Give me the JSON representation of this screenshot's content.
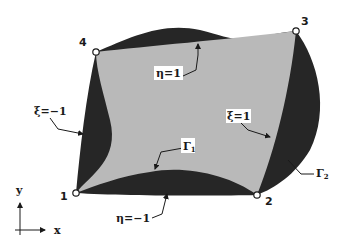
{
  "figure": {
    "colors": {
      "background": "#ffffff",
      "domain_fill": "#b9b9b9",
      "boundary_region_fill": "#262626",
      "line": "#1a1a1a"
    }
  },
  "nodes": [
    {
      "id": "1",
      "label": "1"
    },
    {
      "id": "2",
      "label": "2"
    },
    {
      "id": "3",
      "label": "3"
    },
    {
      "id": "4",
      "label": "4"
    }
  ],
  "edge_labels": {
    "eta_top": "η=1",
    "eta_bottom": "η=−1",
    "xi_left": "ξ=−1",
    "xi_right": "ξ=1"
  },
  "boundary_labels": {
    "gamma1_symbol": "Γ",
    "gamma1_sub": "1",
    "gamma2_symbol": "Γ",
    "gamma2_sub": "2"
  },
  "axes": {
    "x_label": "x",
    "y_label": "y"
  }
}
